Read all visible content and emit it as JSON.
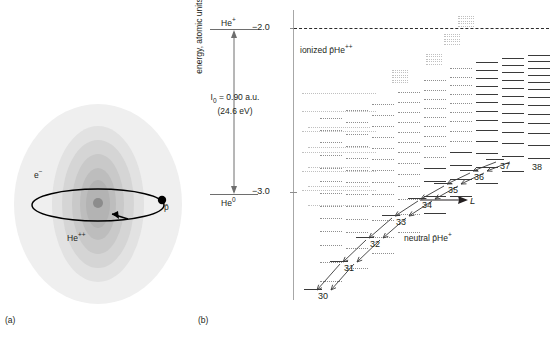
{
  "figure": {
    "panel_a_tag": "(a)",
    "panel_b_tag": "(b)"
  },
  "panel_a": {
    "name": "antiprotonic-helium-atom-schematic",
    "labels": {
      "electron": "e−",
      "electron_html": "e",
      "electron_sup": "−",
      "nucleus": "He",
      "nucleus_sup": "++",
      "antiproton": "p̄"
    },
    "shading_colors": [
      "#efefef",
      "#e2e2e2",
      "#d5d5d5",
      "#c9c9c9",
      "#bdbdbd",
      "#b3b3b3",
      "#8c8c8c"
    ],
    "orbit_color": "#000000"
  },
  "panel_b": {
    "axis": {
      "ylabel": "energy, atomic units",
      "yticks": [
        "−2.0",
        "−3.0"
      ],
      "ytick_values": [
        -2.0,
        -3.0
      ],
      "axis_color": "#a7a7a7"
    },
    "ionization_annotation": {
      "top_state": "He",
      "top_state_sup": "+",
      "bottom_state": "He",
      "bottom_state_sup": "0",
      "line1_pre": "I",
      "line1_sub": "0",
      "line1_post": " = 0.90 a.u.",
      "line2": "(24.6 eV)",
      "value_au": 0.9,
      "value_ev": 24.6
    },
    "region_labels": {
      "ionized": "ionized p̄He",
      "ionized_sup": "++",
      "neutral": "neutral p̄He",
      "neutral_sup": "+",
      "angular_momentum": "L"
    },
    "continuum_line": {
      "label": "−2.0 ionization threshold",
      "style": "dashed",
      "energy": -2.0
    },
    "column_labels": [
      "38",
      "39",
      "40",
      "41",
      "42"
    ],
    "cascade_labels": [
      "30",
      "31",
      "32",
      "33",
      "34",
      "35",
      "36",
      "37"
    ],
    "chart_note": "Level diagram of antiprotonic helium: vertical stacks of energy levels versus angular momentum L, with two parallel radiative cascade chains."
  },
  "chart_data": {
    "type": "scatter",
    "title": "",
    "xlabel": "L",
    "ylabel": "energy, atomic units",
    "ylim": [
      -3.35,
      -1.75
    ],
    "yticks": [
      -2.0,
      -3.0
    ],
    "grid": false,
    "legend": null,
    "columns": [
      {
        "n": "28",
        "x": 106,
        "style": "faint",
        "width": 74,
        "levels_y": [
          93,
          111,
          131,
          152,
          171,
          190
        ]
      },
      {
        "n": "29",
        "x": 112,
        "style": "faint",
        "width": 62,
        "levels_y": [
          127,
          147,
          167,
          186,
          205
        ]
      },
      {
        "n": "30",
        "x": 124,
        "style": "dot",
        "width": 22,
        "levels_y": [
          118,
          130,
          142,
          155,
          168,
          181,
          193,
          206,
          218,
          231,
          245,
          262,
          281
        ]
      },
      {
        "n": "31",
        "x": 150,
        "style": "dot",
        "width": 22,
        "levels_y": [
          110,
          122,
          134,
          146,
          158,
          170,
          182,
          194,
          206,
          219,
          232,
          248,
          268
        ]
      },
      {
        "n": "32",
        "x": 176,
        "style": "dot",
        "width": 22,
        "levels_y": [
          104,
          115,
          126,
          137,
          148,
          159,
          170,
          182,
          194,
          206,
          220,
          237,
          253
        ]
      },
      {
        "n": "33",
        "x": 202,
        "style": "dot",
        "width": 22,
        "levels_y": [
          92,
          102,
          112,
          122,
          132,
          142,
          152,
          163,
          174,
          186,
          199,
          214,
          232
        ]
      },
      {
        "n": "34",
        "x": 228,
        "style": "mixed",
        "width": 22,
        "levels_y": [
          80,
          90,
          99,
          108,
          117,
          126,
          136,
          146,
          157,
          168,
          181,
          196,
          213
        ]
      },
      {
        "n": "35",
        "x": 254,
        "style": "mixed",
        "width": 22,
        "levels_y": [
          68,
          77,
          85,
          94,
          103,
          112,
          121,
          131,
          141,
          152,
          165,
          179,
          196
        ]
      },
      {
        "n": "36",
        "x": 280,
        "style": "solid",
        "width": 22,
        "levels_y": [
          62,
          70,
          78,
          86,
          94,
          102,
          111,
          120,
          130,
          141,
          153,
          167,
          183
        ]
      },
      {
        "n": "37",
        "x": 306,
        "style": "solid",
        "width": 22,
        "levels_y": [
          58,
          65,
          72,
          80,
          88,
          96,
          104,
          113,
          122,
          132,
          143,
          156,
          171
        ]
      },
      {
        "n": "38",
        "x": 332,
        "style": "solid",
        "width": 22,
        "levels_y": [
          55,
          61,
          68,
          75,
          82,
          89,
          97,
          105,
          114,
          123,
          133,
          145,
          158
        ]
      },
      {
        "n": "39",
        "x": 358,
        "style": "solid",
        "width": 22,
        "levels_y": [
          52,
          58,
          64,
          70,
          77,
          84,
          91,
          98,
          106,
          115,
          124,
          135,
          147
        ]
      },
      {
        "n": "40",
        "x": 384,
        "style": "solid",
        "width": 22,
        "levels_y": [
          50,
          55,
          61,
          67,
          73,
          79,
          86,
          93,
          100,
          108,
          117,
          126,
          137
        ]
      },
      {
        "n": "41",
        "x": 410,
        "style": "solid",
        "width": 22,
        "levels_y": [
          48,
          53,
          58,
          64,
          70,
          76,
          82,
          88,
          95,
          102,
          110,
          119,
          128
        ]
      },
      {
        "n": "42",
        "x": 436,
        "style": "solid",
        "width": 22,
        "levels_y": [
          46,
          51,
          56,
          61,
          67,
          72,
          78,
          84,
          90,
          97,
          104,
          112,
          120
        ]
      }
    ],
    "cascade_chain_a": [
      {
        "label": "37",
        "x": 300,
        "y": 162
      },
      {
        "label": "36",
        "x": 274,
        "y": 173
      },
      {
        "label": "35",
        "x": 248,
        "y": 186
      },
      {
        "label": "34",
        "x": 222,
        "y": 201
      },
      {
        "label": "33",
        "x": 196,
        "y": 218
      },
      {
        "label": "32",
        "x": 170,
        "y": 240
      },
      {
        "label": "31",
        "x": 144,
        "y": 264
      },
      {
        "label": "30",
        "x": 118,
        "y": 292
      }
    ],
    "dotted_continuum_clusters": [
      {
        "x": 262,
        "y": 16,
        "count": 5
      },
      {
        "x": 248,
        "y": 34,
        "count": 5
      },
      {
        "x": 230,
        "y": 54,
        "count": 5
      },
      {
        "x": 196,
        "y": 70,
        "count": 6
      }
    ]
  }
}
